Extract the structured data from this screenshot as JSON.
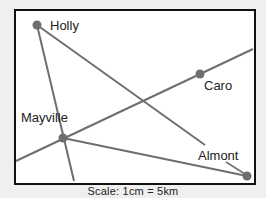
{
  "map": {
    "towns": [
      {
        "name": "Holly",
        "x": 37,
        "y": 25,
        "label_x": 50,
        "label_y": 18
      },
      {
        "name": "Caro",
        "x": 200,
        "y": 74,
        "label_x": 203,
        "label_y": 80
      },
      {
        "name": "Mayville",
        "x": 63,
        "y": 138,
        "label_x": 21,
        "label_y": 111
      },
      {
        "name": "Almont",
        "x": 247,
        "y": 176,
        "label_x": 198,
        "label_y": 148
      }
    ],
    "colors": {
      "line": "#6e6e6e",
      "dot": "#6e6e6e",
      "border": "#111111"
    },
    "scale_label": "Scale: 1cm = 5km"
  }
}
